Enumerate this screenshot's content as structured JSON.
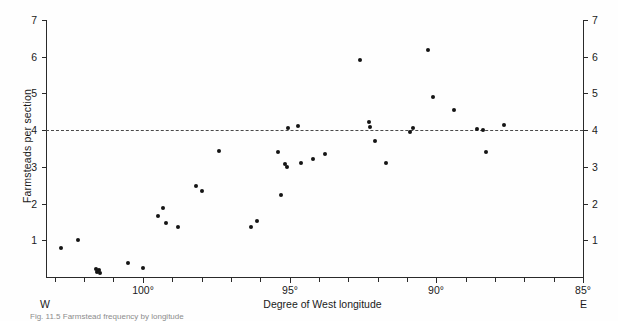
{
  "figure": {
    "y_axis_label": "Farmsteads per section",
    "x_axis_label": "Degree of West longitude",
    "left_edge_label": "W",
    "right_edge_label": "E",
    "caption": "Fig. 11.5  Farmstead frequency by longitude",
    "reference_line_value": "4"
  },
  "chart_data": {
    "type": "scatter",
    "title": "",
    "xlabel": "Degree of West longitude",
    "ylabel": "Farmsteads per section",
    "xlim": [
      103.3,
      85.0
    ],
    "ylim": [
      0,
      7
    ],
    "x_axis_direction": "decreasing-left-to-right",
    "grid": false,
    "legend": null,
    "x_tick_labels": [
      "100°",
      "95°",
      "90°",
      "85°"
    ],
    "x_tick_values": [
      100,
      95,
      90,
      85
    ],
    "x_minor_tick_step": 1,
    "y_tick_labels": [
      "1",
      "2",
      "3",
      "4",
      "5",
      "6",
      "7"
    ],
    "y_tick_values": [
      1,
      2,
      3,
      4,
      5,
      6,
      7
    ],
    "y_axis_duplicated_right": true,
    "annotations": [
      {
        "type": "hline",
        "y": 4,
        "style": "dashed",
        "label": "4"
      },
      {
        "type": "text",
        "text": "W",
        "position": "below-axis-left"
      },
      {
        "type": "text",
        "text": "E",
        "position": "below-axis-right"
      }
    ],
    "series": [
      {
        "name": "Farmsteads per section",
        "marker": "filled-circle",
        "color": "#141414",
        "points": [
          {
            "x": 102.8,
            "y": 0.78
          },
          {
            "x": 102.2,
            "y": 1.0
          },
          {
            "x": 101.6,
            "y": 0.22
          },
          {
            "x": 101.55,
            "y": 0.15
          },
          {
            "x": 101.5,
            "y": 0.2
          },
          {
            "x": 101.45,
            "y": 0.12
          },
          {
            "x": 100.5,
            "y": 0.37
          },
          {
            "x": 100.0,
            "y": 0.25
          },
          {
            "x": 99.5,
            "y": 1.65
          },
          {
            "x": 99.3,
            "y": 1.87
          },
          {
            "x": 99.2,
            "y": 1.47
          },
          {
            "x": 98.8,
            "y": 1.37
          },
          {
            "x": 98.2,
            "y": 2.48
          },
          {
            "x": 98.0,
            "y": 2.35
          },
          {
            "x": 97.4,
            "y": 3.42
          },
          {
            "x": 96.3,
            "y": 1.36
          },
          {
            "x": 96.1,
            "y": 1.54
          },
          {
            "x": 95.4,
            "y": 3.4
          },
          {
            "x": 95.3,
            "y": 2.24
          },
          {
            "x": 95.15,
            "y": 3.07
          },
          {
            "x": 95.1,
            "y": 3.0
          },
          {
            "x": 95.05,
            "y": 4.05
          },
          {
            "x": 94.7,
            "y": 4.12
          },
          {
            "x": 94.6,
            "y": 3.1
          },
          {
            "x": 94.2,
            "y": 3.22
          },
          {
            "x": 93.8,
            "y": 3.35
          },
          {
            "x": 92.6,
            "y": 5.9
          },
          {
            "x": 92.3,
            "y": 4.22
          },
          {
            "x": 92.25,
            "y": 4.1
          },
          {
            "x": 92.1,
            "y": 3.7
          },
          {
            "x": 91.7,
            "y": 3.12
          },
          {
            "x": 90.9,
            "y": 3.95
          },
          {
            "x": 90.8,
            "y": 4.05
          },
          {
            "x": 90.3,
            "y": 6.18
          },
          {
            "x": 90.1,
            "y": 4.9
          },
          {
            "x": 89.4,
            "y": 4.55
          },
          {
            "x": 88.6,
            "y": 4.02
          },
          {
            "x": 88.4,
            "y": 4.0
          },
          {
            "x": 88.3,
            "y": 3.4
          },
          {
            "x": 87.7,
            "y": 4.15
          }
        ]
      }
    ]
  }
}
